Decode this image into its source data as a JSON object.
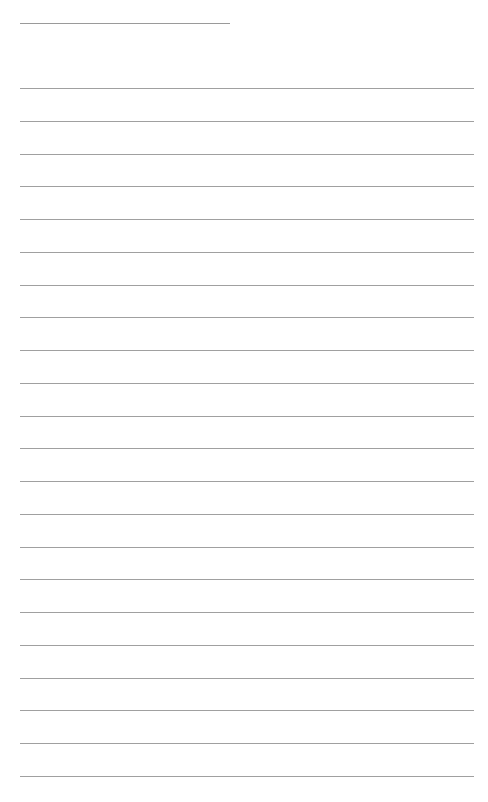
{
  "page": {
    "background": "#ffffff",
    "line_color": "#a0a0a0",
    "header_line": {
      "x": 20,
      "y": 23,
      "width": 210
    },
    "ruled_lines": {
      "x": 20,
      "width": 454,
      "start_y": 88,
      "spacing": 32.75,
      "count": 22
    },
    "text": []
  }
}
